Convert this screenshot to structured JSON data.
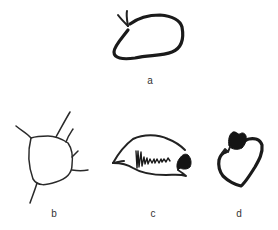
{
  "figures": [
    {
      "id": "a",
      "label": "a",
      "description": "oval closed shape with two short strokes at top-left"
    },
    {
      "id": "b",
      "label": "b",
      "description": "rounded shape with radiating lines"
    },
    {
      "id": "c",
      "label": "c",
      "description": "fish-like shape with zigzag scribble and dark mouth mark"
    },
    {
      "id": "d",
      "label": "d",
      "description": "heart-like shape with dark scribbled top-left"
    }
  ],
  "colors": {
    "ink": "#1a1a1a",
    "background": "#ffffff",
    "label": "#333333"
  }
}
